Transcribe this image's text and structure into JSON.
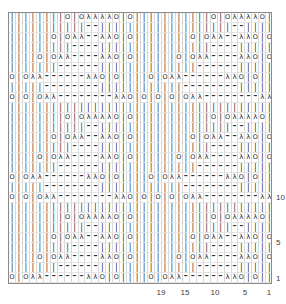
{
  "chart": {
    "kind": "knitting-stitch-chart",
    "grid": {
      "columns": 44,
      "rows": 30,
      "cell_width_px": 5.95,
      "cell_height_px": 9,
      "border_color": "#8a8a8a",
      "gridline_color": "#d8d8d8",
      "background": "#ffffff"
    },
    "symbol_legend": {
      "|": "knit",
      "O": "yarn-over",
      "λ": "decrease",
      "–": "purl-or-no-stitch",
      " ": "empty"
    },
    "x_axis": {
      "name": "stitch-number-axis",
      "direction": "right-to-left",
      "ticks": [
        {
          "label": "19",
          "column": 19
        },
        {
          "label": "15",
          "column": 15
        },
        {
          "label": "10",
          "column": 10
        },
        {
          "label": "5",
          "column": 5
        },
        {
          "label": "1",
          "column": 1
        }
      ]
    },
    "y_axis": {
      "name": "row-number-axis",
      "direction": "bottom-to-top",
      "ticks": [
        {
          "label": "10",
          "row": 10
        },
        {
          "label": "5",
          "row": 5
        },
        {
          "label": "1",
          "row": 1
        }
      ]
    }
  },
  "chart_data": {
    "type": "heatmap",
    "xlabel": "",
    "ylabel": "",
    "categories": [
      "1",
      "2",
      "3",
      "4",
      "5",
      "6",
      "7",
      "8",
      "9",
      "10",
      "11",
      "12",
      "13",
      "14",
      "15",
      "16",
      "17",
      "18",
      "19",
      "20",
      "21",
      "22",
      "23",
      "24",
      "25",
      "26",
      "27",
      "28",
      "29",
      "30",
      "31",
      "32",
      "33",
      "34",
      "35",
      "36",
      "37",
      "38",
      "39",
      "40",
      "41",
      "42",
      "43",
      "44"
    ],
    "legend_position": "none",
    "grid": true,
    "xlim": [
      1,
      44
    ],
    "ylim": [
      1,
      30
    ],
    "horizontal_repeat": 22,
    "vertical_repeat": 15,
    "rows": [
      "||||||||O|OλλλλO|O|||||||||||O|OλλλλO|O|||||",
      "|||||||||||––|||||||||||||||||||––||||||||",
      "||||||O|Oλλ––λλO|O||||||||O|Oλλ––λλO|O||||",
      "|||||||||––––||||||||||||||||––––|||||||",
      "||||O|Oλλ––––λλO|O||||||O|Oλλ––––λλO|O|||",
      "|||||||––––––||||||||||||||––––––||||||",
      "O|Oλλ––––––λλO|O||||O|Oλλ––––––λλO|O||",
      "|||||––––––––||||||||||||––––––––|||||",
      "O|O|Oλλ––––––––λλO|O|O|O|Oλλ––––––––λλO|O",
      "||||||||||||||||||||||||||||||||||||||||||||",
      "||||||||O|OλλλλO|O|||||||||||O|OλλλλO|O|||||",
      "|||||||||||––|||||||||||||||||||––||||||||",
      "||||||O|Oλλ––λλO|O||||||||O|Oλλ––λλO|O||||",
      "|||||||||––––||||||||||||||||––––|||||||",
      "||||O|Oλλ––––λλO|O||||||O|Oλλ––––λλO|O|||",
      "|||||||––––––||||||||||||||––––––||||||",
      "O|Oλλ––––––λλO|O||||O|Oλλ––––––λλO|O||",
      "|||||––––––––||||||||||||––––––––|||||",
      "O|O|Oλλ––––––––λλO|O|O|O|Oλλ––––––––λλO|O",
      "||||||||||||||||||||||||||||||||||||||||||||",
      "||||||||O|OλλλλO|O|||||||||||O|OλλλλO|O|||||",
      "|||||||||||––|||||||||||||||||||––||||||||",
      "||||||O|Oλλ––λλO|O||||||||O|Oλλ––λλO|O||||",
      "|||||||||––––||||||||||||||||––––|||||||",
      "||||O|Oλλ––––λλO|O||||||O|Oλλ––––λλO|O|||",
      "|||||||––––––||||||||||||||––––––||||||",
      "O|Oλλ––––––λλO|O||||O|Oλλ––––––λλO|O||",
      "|||||––––––––||||||||||||––––––––|||||",
      "O|O|Oλλ––––––––λλO|O|O|O|Oλλ––––––––λλO|O",
      "||||||||||||||||||||||||||||||||||||||||||||"
    ]
  }
}
